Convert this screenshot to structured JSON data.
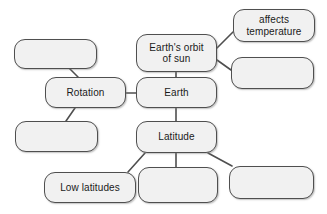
{
  "diagram": {
    "type": "concept-map",
    "canvas": {
      "width": 327,
      "height": 214,
      "background": "#ffffff"
    },
    "style": {
      "node_fill": "#f1f1f1",
      "node_border": "#4f4f4f",
      "connector_color": "#4f4f4f",
      "text_color": "#1a1a1a"
    },
    "nodes": [
      {
        "id": "n-top-left-blank",
        "label": "",
        "empty": true,
        "x": 14,
        "y": 39,
        "w": 83,
        "h": 30
      },
      {
        "id": "n-earths-orbit",
        "label": "Earth's orbit\nof sun",
        "empty": false,
        "x": 136,
        "y": 34,
        "w": 81,
        "h": 38
      },
      {
        "id": "n-affects-temperature",
        "label": "affects\ntemperature",
        "empty": false,
        "x": 233,
        "y": 9,
        "w": 82,
        "h": 33
      },
      {
        "id": "n-right-blank",
        "label": "",
        "empty": true,
        "x": 231,
        "y": 57,
        "w": 83,
        "h": 32
      },
      {
        "id": "n-rotation",
        "label": "Rotation",
        "empty": false,
        "x": 45,
        "y": 77,
        "w": 81,
        "h": 31
      },
      {
        "id": "n-earth",
        "label": "Earth",
        "empty": false,
        "x": 136,
        "y": 77,
        "w": 81,
        "h": 31
      },
      {
        "id": "n-mid-left-blank",
        "label": "",
        "empty": true,
        "x": 15,
        "y": 121,
        "w": 83,
        "h": 31
      },
      {
        "id": "n-latitude",
        "label": "Latitude",
        "empty": false,
        "x": 136,
        "y": 121,
        "w": 81,
        "h": 32
      },
      {
        "id": "n-low-latitudes",
        "label": "Low latitudes",
        "empty": false,
        "x": 44,
        "y": 172,
        "w": 92,
        "h": 31
      },
      {
        "id": "n-bottom-mid-blank",
        "label": "",
        "empty": true,
        "x": 138,
        "y": 167,
        "w": 80,
        "h": 36
      },
      {
        "id": "n-bottom-right-blank",
        "label": "",
        "empty": true,
        "x": 229,
        "y": 166,
        "w": 85,
        "h": 33
      }
    ],
    "connectors": [
      {
        "id": "c-orbit-affects",
        "from": "n-earths-orbit",
        "to": "n-affects-temperature",
        "x1": 217,
        "y1": 48,
        "x2": 233,
        "y2": 32
      },
      {
        "id": "c-orbit-rightblank",
        "from": "n-earths-orbit",
        "to": "n-right-blank",
        "x1": 217,
        "y1": 60,
        "x2": 231,
        "y2": 70
      },
      {
        "id": "c-orbit-earth",
        "from": "n-earths-orbit",
        "to": "n-earth",
        "x1": 176,
        "y1": 72,
        "x2": 176,
        "y2": 77
      },
      {
        "id": "c-rotation-earth",
        "from": "n-rotation",
        "to": "n-earth",
        "x1": 126,
        "y1": 93,
        "x2": 136,
        "y2": 93
      },
      {
        "id": "c-topleft-rotation",
        "from": "n-top-left-blank",
        "to": "n-rotation",
        "x1": 70,
        "y1": 69,
        "x2": 78,
        "y2": 77
      },
      {
        "id": "c-rotation-midleft",
        "from": "n-rotation",
        "to": "n-mid-left-blank",
        "x1": 75,
        "y1": 108,
        "x2": 66,
        "y2": 121
      },
      {
        "id": "c-earth-latitude",
        "from": "n-earth",
        "to": "n-latitude",
        "x1": 176,
        "y1": 108,
        "x2": 176,
        "y2": 121
      },
      {
        "id": "c-latitude-lowlat",
        "from": "n-latitude",
        "to": "n-low-latitudes",
        "x1": 145,
        "y1": 153,
        "x2": 128,
        "y2": 172
      },
      {
        "id": "c-latitude-bottommid",
        "from": "n-latitude",
        "to": "n-bottom-mid-blank",
        "x1": 176,
        "y1": 153,
        "x2": 176,
        "y2": 167
      },
      {
        "id": "c-latitude-bottomright",
        "from": "n-latitude",
        "to": "n-bottom-right-blank",
        "x1": 208,
        "y1": 153,
        "x2": 232,
        "y2": 166
      }
    ]
  }
}
